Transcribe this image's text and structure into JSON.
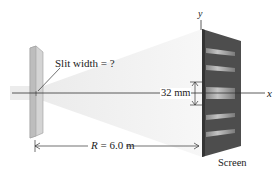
{
  "diagram": {
    "labels": {
      "slit_width": "Slit width = ?",
      "fringe_width": "32 mm",
      "distance": "R = 6.0 m",
      "screen": "Screen",
      "x_axis": "x",
      "y_axis": "y"
    },
    "values": {
      "central_fringe_width_mm": 32,
      "distance_R_m": 6.0,
      "slit_width": "?"
    },
    "colors": {
      "slit": "#c8c8c8",
      "screen": "#4a4a4a",
      "fringe": "#b8b8b8",
      "beam": "#f0f0f0",
      "lines": "#333333"
    }
  }
}
